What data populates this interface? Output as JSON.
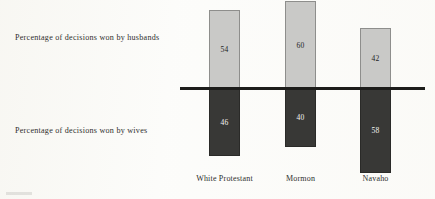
{
  "chart_data": {
    "type": "bar",
    "title": "",
    "subtitle": "",
    "xlabel": "",
    "ylabel": "",
    "orientation": "vertical",
    "layout": "diverging-stacked",
    "grid": false,
    "legend_position": "left-inline",
    "axis_baseline_value": 0,
    "value_unit": "percent",
    "categories": [
      "White Protestant",
      "Mormon",
      "Navaho"
    ],
    "series": [
      {
        "name": "Percentage of decisions won by husbands",
        "direction": "up",
        "color": "#c9c9c7",
        "values": [
          54,
          60,
          42
        ]
      },
      {
        "name": "Percentage of decisions won by wives",
        "direction": "down",
        "color": "#383836",
        "values": [
          46,
          40,
          58
        ]
      }
    ]
  },
  "labels": {
    "husbands": "Percentage of decisions won by husbands",
    "wives": "Percentage of decisions won by wives"
  },
  "colors": {
    "husbands_bar": "#c9c9c7",
    "wives_bar": "#383836",
    "baseline": "#1d1d1b",
    "background": "#fcfcfa",
    "text": "#2e2e2c"
  }
}
